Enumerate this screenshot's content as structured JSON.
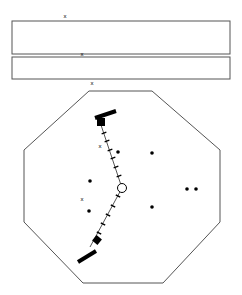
{
  "canvas": {
    "width": 242,
    "height": 295,
    "background": "#ffffff",
    "stroke": "#000000"
  },
  "diagram": {
    "title": "",
    "type": "geometric-schematic"
  },
  "rectangles": [
    {
      "name": "upper-rectangle",
      "x": 12,
      "y": 21,
      "width": 218,
      "height": 33,
      "stroke": "#555555",
      "fill": "none"
    },
    {
      "name": "lower-rectangle",
      "x": 12,
      "y": 57,
      "width": 218,
      "height": 22,
      "stroke": "#555555",
      "fill": "none"
    }
  ],
  "octagon": {
    "name": "octagon-outline",
    "stroke": "#555555",
    "fill": "none",
    "points": "89,91 152,91 220,150 220,222 163,283 83,283 24,222 24,150"
  },
  "x_markers": [
    {
      "label": "x",
      "x": 65,
      "y": 16
    },
    {
      "label": "x",
      "x": 82,
      "y": 54
    },
    {
      "label": "x",
      "x": 92,
      "y": 83
    },
    {
      "label": "x",
      "x": 100,
      "y": 146
    },
    {
      "label": "x",
      "x": 82,
      "y": 199
    }
  ],
  "polyline": {
    "name": "hatched-zigzag-path",
    "stroke": "#555555",
    "points": "100,122 122,188 90,247"
  },
  "end_bars": [
    {
      "name": "upper-end-bar",
      "x1": 95,
      "y1": 118,
      "x2": 116,
      "y2": 111,
      "width": 4,
      "fill": "#000000"
    },
    {
      "name": "lower-end-bar",
      "x1": 78,
      "y1": 262,
      "x2": 96,
      "y2": 251,
      "width": 4,
      "fill": "#000000"
    }
  ],
  "squares": [
    {
      "name": "upper-filled-square",
      "cx": 101,
      "cy": 122,
      "size": 8,
      "rotation": 0,
      "fill": "#000000"
    },
    {
      "name": "lower-filled-square",
      "cx": 97,
      "cy": 240,
      "size": 7,
      "rotation": 40,
      "fill": "#000000"
    }
  ],
  "circle_node": {
    "name": "circle-node",
    "cx": 122,
    "cy": 188,
    "r": 4.5,
    "stroke": "#000000",
    "fill": "#ffffff"
  },
  "ticks_upper": [
    {
      "cx": 104,
      "cy": 133
    },
    {
      "cx": 107,
      "cy": 141
    },
    {
      "cx": 110,
      "cy": 150
    },
    {
      "cx": 113,
      "cy": 158
    },
    {
      "cx": 116,
      "cy": 167
    },
    {
      "cx": 119,
      "cy": 176
    }
  ],
  "ticks_lower": [
    {
      "cx": 118,
      "cy": 196
    },
    {
      "cx": 113,
      "cy": 206
    },
    {
      "cx": 108,
      "cy": 215
    },
    {
      "cx": 103,
      "cy": 224
    },
    {
      "cx": 99,
      "cy": 233
    }
  ],
  "dots": [
    {
      "name": "dot-1",
      "cx": 90,
      "cy": 181
    },
    {
      "name": "dot-2",
      "cx": 89,
      "cy": 211
    },
    {
      "name": "dot-3",
      "cx": 118,
      "cy": 152
    },
    {
      "name": "dot-4",
      "cx": 152,
      "cy": 153
    },
    {
      "name": "dot-5",
      "cx": 152,
      "cy": 207
    },
    {
      "name": "dot-6",
      "cx": 187,
      "cy": 189
    },
    {
      "name": "dot-7",
      "cx": 196,
      "cy": 189
    }
  ],
  "dot_style": {
    "r": 1.8,
    "fill": "#000000"
  },
  "tick_style": {
    "length": 5,
    "stroke": "#000000",
    "stroke_width": 1.4
  }
}
